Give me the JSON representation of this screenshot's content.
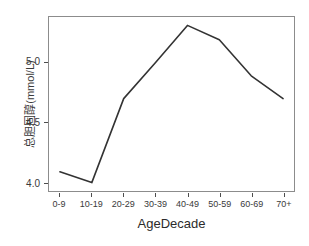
{
  "chart_data": {
    "type": "line",
    "title": "",
    "xlabel": "AgeDecade",
    "ylabel": "总胆固醇(mmol/L)",
    "categories": [
      "0-9",
      "10-19",
      "20-29",
      "30-39",
      "40-49",
      "50-59",
      "60-69",
      "70+"
    ],
    "values": [
      4.09,
      4.0,
      4.7,
      5.0,
      5.31,
      5.19,
      4.89,
      4.7
    ],
    "series": [
      {
        "name": "总胆固醇",
        "values": [
          4.09,
          4.0,
          4.7,
          5.0,
          5.31,
          5.19,
          4.89,
          4.7
        ]
      }
    ],
    "ylim": [
      3.93,
      5.38
    ],
    "xlim": [
      0,
      7
    ],
    "y_ticks": [
      4.0,
      4.5,
      5.0
    ],
    "y_tick_labels": [
      "4.0",
      "4.5",
      "5.0"
    ],
    "grid": false,
    "legend": false,
    "legend_position": "none",
    "line_color": "#333333",
    "line_width": 1.6,
    "panel_border_color": "#8c8c8c",
    "background_color": "#ffffff",
    "axis_text_color": "#3a3a3a"
  },
  "axes": {
    "y": {
      "title": "总胆固醇(mmol/L)",
      "ticks": [
        {
          "label": "5.0",
          "value": 5.0
        },
        {
          "label": "4.5",
          "value": 4.5
        },
        {
          "label": "4.0",
          "value": 4.0
        }
      ]
    },
    "x": {
      "title": "AgeDecade",
      "ticks": [
        {
          "label": "0-9"
        },
        {
          "label": "10-19"
        },
        {
          "label": "20-29"
        },
        {
          "label": "30-39"
        },
        {
          "label": "40-49"
        },
        {
          "label": "50-59"
        },
        {
          "label": "60-69"
        },
        {
          "label": "70+"
        }
      ]
    }
  }
}
